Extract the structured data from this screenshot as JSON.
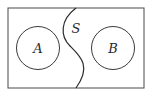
{
  "diagram": {
    "type": "venn-separation",
    "universe": {
      "x": 8,
      "y": 8,
      "width": 136,
      "height": 80,
      "stroke": "#3a3a3a"
    },
    "sets": [
      {
        "label": "A",
        "cx": 38,
        "cy": 48,
        "r": 21.5
      },
      {
        "label": "B",
        "cx": 113,
        "cy": 48,
        "r": 21.5
      }
    ],
    "separator": {
      "label": "S",
      "label_x": 75,
      "label_y": 34
    },
    "colors": {
      "line": "#3a3a3a",
      "text": "#2a2a2a",
      "background": "#ffffff"
    }
  }
}
